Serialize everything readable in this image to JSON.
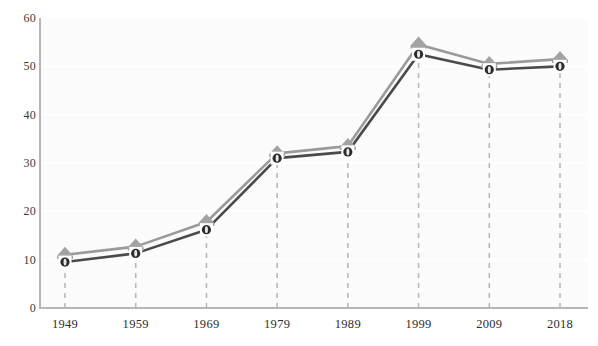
{
  "chart_data": {
    "type": "line",
    "title": "",
    "subtitle": "",
    "xlabel": "",
    "ylabel": "",
    "categories": [
      "1949",
      "1959",
      "1969",
      "1979",
      "1989",
      "1999",
      "2009",
      "2018"
    ],
    "x": [
      1949,
      1959,
      1969,
      1979,
      1989,
      1999,
      2009,
      2018
    ],
    "series": [
      {
        "name": "upper-series",
        "marker": "triangle",
        "color": "#9a9a9a",
        "values": [
          11,
          12.7,
          17.8,
          32,
          33.5,
          54.5,
          50.5,
          51.5
        ]
      },
      {
        "name": "lower-series",
        "marker": "circle",
        "color": "#4a4a4a",
        "values": [
          9.5,
          11.3,
          16.2,
          31,
          32.3,
          52.5,
          49.3,
          50
        ]
      }
    ],
    "ylim": [
      0,
      60
    ],
    "ytick_values": [
      0,
      10,
      20,
      30,
      40,
      50,
      60
    ],
    "ytick_labels": [
      "0",
      "10",
      "20",
      "30",
      "40",
      "50",
      "60"
    ],
    "grid": {
      "horizontal": true,
      "vertical_dashed_droplines": true,
      "horizontal_color": "#ffffff",
      "dropline_color": "#b9b9b9"
    },
    "legend": {
      "visible": false,
      "position": "none",
      "entries": []
    },
    "annotations": [],
    "plot_background": "#fbfbfb",
    "axis_color": "#b6b6b6"
  },
  "colors": {
    "page_background": "#ffffff",
    "plot_background": "#fbfbfb",
    "axis": "#b6b6b6",
    "upper_line": "#9a9a9a",
    "upper_marker_fill": "#a3a3a3",
    "lower_line": "#4a4a4a",
    "lower_marker_fill": "#2b2b2b",
    "marker_halo": "#ffffff",
    "dropline": "#b9b9b9",
    "tick_text": "#2e2e2e",
    "gridline": "#ffffff"
  }
}
